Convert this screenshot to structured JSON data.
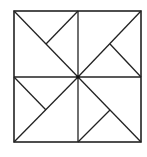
{
  "diagram": {
    "type": "pinwheel-square",
    "stroke_color": "#222222",
    "background": "#ffffff",
    "outer_square": {
      "x": 14,
      "y": 11,
      "width": 127,
      "height": 131
    },
    "center": {
      "x": 78,
      "y": 77
    },
    "segments": [
      {
        "name": "vertical-midline",
        "x1": 78,
        "y1": 11,
        "x2": 78,
        "y2": 142
      },
      {
        "name": "horizontal-midline",
        "x1": 14,
        "y1": 77,
        "x2": 141,
        "y2": 77
      },
      {
        "name": "diagonal-top-left",
        "x1": 14,
        "y1": 11,
        "x2": 78,
        "y2": 77
      },
      {
        "name": "diagonal-top-right",
        "x1": 141,
        "y1": 11,
        "x2": 78,
        "y2": 77
      },
      {
        "name": "diagonal-bottom-left",
        "x1": 14,
        "y1": 142,
        "x2": 78,
        "y2": 77
      },
      {
        "name": "diagonal-bottom-right",
        "x1": 141,
        "y1": 142,
        "x2": 78,
        "y2": 77
      },
      {
        "name": "short-top-left",
        "x1": 78,
        "y1": 11,
        "x2": 46,
        "y2": 44
      },
      {
        "name": "short-top-right",
        "x1": 141,
        "y1": 77,
        "x2": 110,
        "y2": 44
      },
      {
        "name": "short-bottom-left",
        "x1": 14,
        "y1": 77,
        "x2": 46,
        "y2": 110
      },
      {
        "name": "short-bottom-right",
        "x1": 78,
        "y1": 142,
        "x2": 110,
        "y2": 110
      }
    ]
  }
}
